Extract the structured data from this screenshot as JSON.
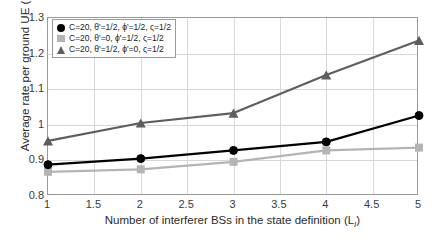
{
  "chart_data": {
    "type": "line",
    "title": "",
    "xlabel": "Number of interferer BSs in the state definition (L",
    "xlabel_sub": "I",
    "xlabel_tail": ")",
    "ylabel": "Average rate per ground UE (Mbps)",
    "x": [
      1,
      2,
      3,
      4,
      5
    ],
    "xlim": [
      1,
      5
    ],
    "ylim": [
      0.8,
      1.3
    ],
    "xticks": [
      "1",
      "1.5",
      "2",
      "2.5",
      "3",
      "3.5",
      "4",
      "4.5",
      "5"
    ],
    "xtick_values": [
      1,
      1.5,
      2,
      2.5,
      3,
      3.5,
      4,
      4.5,
      5
    ],
    "yticks": [
      "0.8",
      "0.9",
      "1",
      "1.1",
      "1.2",
      "1.3"
    ],
    "ytick_values": [
      0.8,
      0.9,
      1.0,
      1.1,
      1.2,
      1.3
    ],
    "grid": true,
    "legend_position": "top-left",
    "series": [
      {
        "name": "C=20, θ'=1/2, ϕ'=1/2, ς=1/2",
        "marker": "circle",
        "color": "#000000",
        "values": [
          0.888,
          0.905,
          0.928,
          0.952,
          1.026
        ]
      },
      {
        "name": "C=20, θ'=0, ϕ'=1/2, ς=1/2",
        "marker": "square",
        "color": "#b4b4b4",
        "values": [
          0.868,
          0.875,
          0.896,
          0.928,
          0.936
        ]
      },
      {
        "name": "C=20, θ'=1/2, ϕ'=0, ς=1/2",
        "marker": "triangle",
        "color": "#5e5e5e",
        "values": [
          0.955,
          1.005,
          1.033,
          1.14,
          1.237
        ]
      }
    ]
  },
  "legend": {
    "entries": [
      "C=20, θ'=1/2, ϕ'=1/2, ς=1/2",
      "C=20, θ'=0, ϕ'=1/2, ς=1/2",
      "C=20, θ'=1/2, ϕ'=0, ς=1/2"
    ]
  }
}
